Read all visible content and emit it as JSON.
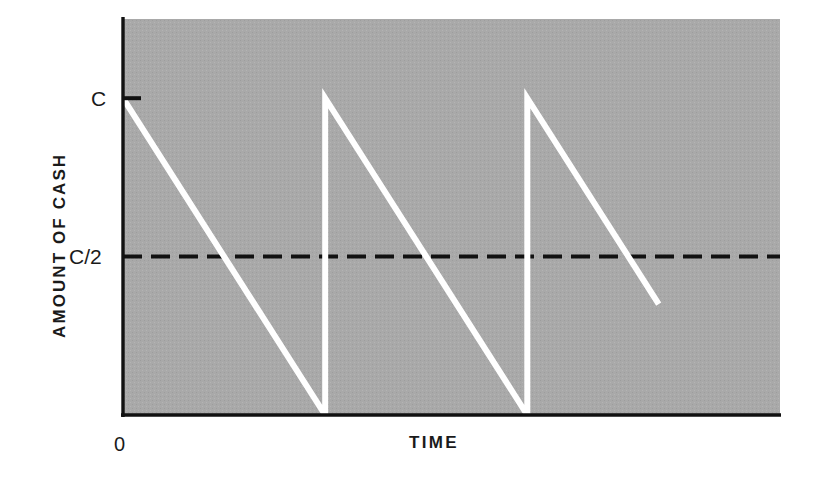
{
  "figure": {
    "background_color": "#ffffff",
    "plot_fill_color": "#a9a9a9",
    "axis_color": "#111111",
    "series_color": "#ffffff",
    "reference_line_color": "#111111"
  },
  "axes": {
    "y_title": "AMOUNT OF CASH",
    "x_title": "TIME",
    "origin_label": "0",
    "y_ticks": [
      {
        "id": "c",
        "label": "C",
        "value": 1.0
      },
      {
        "id": "c_half",
        "label": "C/2",
        "value": 0.5
      }
    ]
  },
  "chart_data": {
    "type": "line",
    "title": "",
    "subtitle": "",
    "xlabel": "TIME",
    "ylabel": "AMOUNT OF CASH",
    "xlim": [
      0,
      3.25
    ],
    "ylim": [
      0,
      1.25
    ],
    "grid": false,
    "legend": "none",
    "y_tick_labels": [
      "C/2",
      "C"
    ],
    "y_tick_values": [
      0.5,
      1.0
    ],
    "x_tick_labels": [
      "0"
    ],
    "x_tick_values": [
      0
    ],
    "annotations": [
      {
        "name": "origin",
        "text": "0",
        "x": 0,
        "y": 0
      }
    ],
    "series": [
      {
        "name": "cash-balance",
        "style": "solid",
        "color": "#ffffff",
        "width": 6,
        "points": [
          {
            "x": 0.0,
            "y": 1.0
          },
          {
            "x": 1.0,
            "y": 0.0
          },
          {
            "x": 1.0,
            "y": 1.0
          },
          {
            "x": 2.0,
            "y": 0.0
          },
          {
            "x": 2.0,
            "y": 1.0
          },
          {
            "x": 2.65,
            "y": 0.35
          }
        ]
      },
      {
        "name": "average-cash-holding",
        "style": "dashed",
        "color": "#111111",
        "width": 4,
        "label": "C/2",
        "points": [
          {
            "x": 0.0,
            "y": 0.5
          },
          {
            "x": 3.25,
            "y": 0.5
          }
        ]
      }
    ]
  }
}
